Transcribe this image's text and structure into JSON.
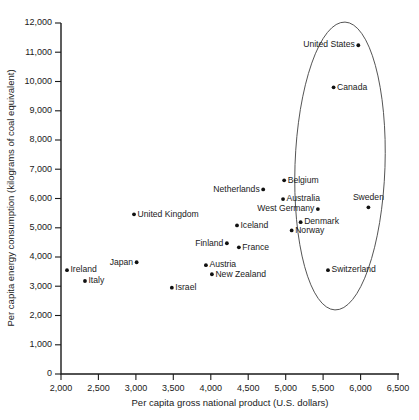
{
  "chart_data": {
    "type": "scatter",
    "title": "",
    "xlabel": "Per capita gross national product (U.S. dollars)",
    "ylabel": "Per capita energy consumption (kilograms of coal equivalent)",
    "xlim": [
      2000,
      6500
    ],
    "ylim": [
      0,
      12000
    ],
    "grid": false,
    "legend": "none",
    "xticks": [
      "2,000",
      "2,500",
      "3,000",
      "3,500",
      "4,000",
      "4,500",
      "5,000",
      "5,500",
      "6,000",
      "6,500"
    ],
    "xtick_values": [
      2000,
      2500,
      3000,
      3500,
      4000,
      4500,
      5000,
      5500,
      6000,
      6500
    ],
    "yticks": [
      "0",
      "1,000",
      "2,000",
      "3,000",
      "4,000",
      "5,000",
      "6,000",
      "7,000",
      "8,000",
      "9,000",
      "10,000",
      "11,000",
      "12,000"
    ],
    "ytick_values": [
      0,
      1000,
      2000,
      3000,
      4000,
      5000,
      6000,
      7000,
      8000,
      9000,
      10000,
      11000,
      12000
    ],
    "points": [
      {
        "label": "United States",
        "x": 5970,
        "y": 11240,
        "label_side": "left"
      },
      {
        "label": "Canada",
        "x": 5640,
        "y": 9800,
        "label_side": "right"
      },
      {
        "label": "Sweden",
        "x": 6105,
        "y": 5700,
        "label_side": "above"
      },
      {
        "label": "Belgium",
        "x": 4980,
        "y": 6620,
        "label_side": "right"
      },
      {
        "label": "Netherlands",
        "x": 4700,
        "y": 6310,
        "label_side": "left"
      },
      {
        "label": "Australia",
        "x": 4965,
        "y": 5980,
        "label_side": "right"
      },
      {
        "label": "West Germany",
        "x": 5430,
        "y": 5640,
        "label_side": "left"
      },
      {
        "label": "Denmark",
        "x": 5200,
        "y": 5190,
        "label_side": "right"
      },
      {
        "label": "Iceland",
        "x": 4350,
        "y": 5080,
        "label_side": "right"
      },
      {
        "label": "Norway",
        "x": 5080,
        "y": 4910,
        "label_side": "right"
      },
      {
        "label": "France",
        "x": 4375,
        "y": 4330,
        "label_side": "right"
      },
      {
        "label": "Finland",
        "x": 4215,
        "y": 4470,
        "label_side": "left"
      },
      {
        "label": "Austria",
        "x": 3935,
        "y": 3720,
        "label_side": "right"
      },
      {
        "label": "New Zealand",
        "x": 4015,
        "y": 3410,
        "label_side": "right"
      },
      {
        "label": "Switzerland",
        "x": 5565,
        "y": 3550,
        "label_side": "right"
      },
      {
        "label": "United Kingdom",
        "x": 2975,
        "y": 5460,
        "label_side": "right"
      },
      {
        "label": "Japan",
        "x": 3010,
        "y": 3820,
        "label_side": "left"
      },
      {
        "label": "Ireland",
        "x": 2080,
        "y": 3550,
        "label_side": "right"
      },
      {
        "label": "Italy",
        "x": 2320,
        "y": 3180,
        "label_side": "right"
      },
      {
        "label": "Israel",
        "x": 3480,
        "y": 2950,
        "label_side": "right"
      }
    ],
    "annotations": [
      {
        "name": "highlight-ellipse",
        "shape": "ellipse",
        "description": "Hand-drawn oval enclosing the high-GNP, high-energy cluster"
      }
    ]
  }
}
